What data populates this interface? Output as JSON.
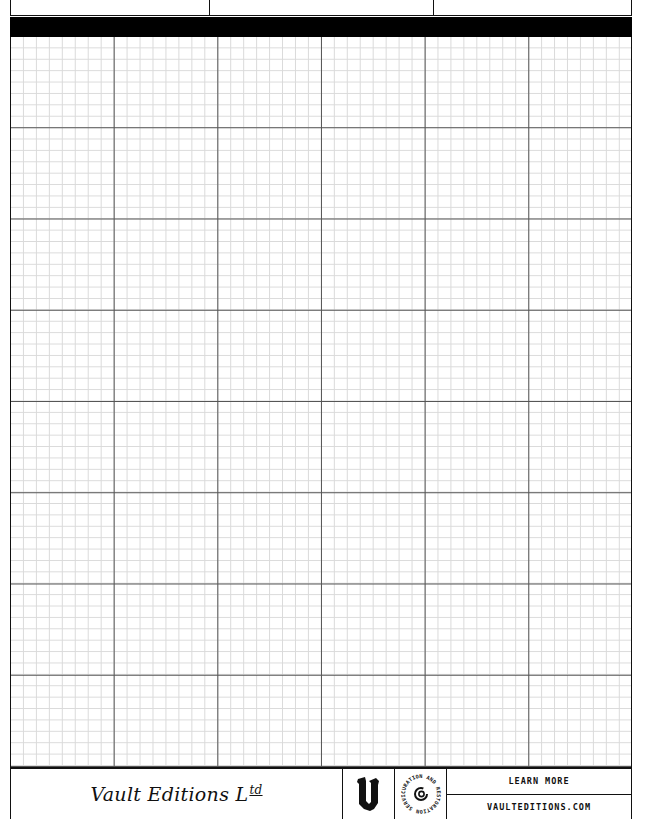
{
  "page": {
    "type": "graph paper sheet",
    "grid": {
      "major_columns": 6,
      "major_rows": 8,
      "minor_per_major": 8,
      "major_line_color": "#555555",
      "minor_line_color": "#dadada",
      "border_color": "#111111"
    },
    "header": {
      "boxes": [
        "",
        "",
        ""
      ],
      "bar_color": "#000000"
    }
  },
  "footer": {
    "brand": "Vault Editions L",
    "brand_suffix": "td",
    "logo_icon": "gothic-v-logo-icon",
    "seal_text": "CURATION AND RESTORATION SERVICES · ",
    "seal_icon": "spiral-c-icon",
    "learn_more": "LEARN MORE",
    "url": "VAULTEDITIONS.COM"
  }
}
